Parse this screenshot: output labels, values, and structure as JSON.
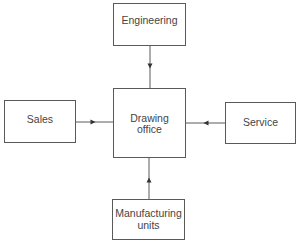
{
  "diagram": {
    "type": "block-diagram",
    "nodes": {
      "engineering": {
        "label": "Engineering"
      },
      "sales": {
        "label": "Sales"
      },
      "drawing_office": {
        "label": "Drawing\noffice"
      },
      "service": {
        "label": "Service"
      },
      "manufacturing": {
        "label": "Manufacturing\nunits"
      }
    },
    "edges": [
      {
        "from": "Engineering",
        "to": "Drawing office",
        "direction": "down"
      },
      {
        "from": "Sales",
        "to": "Drawing office",
        "direction": "right"
      },
      {
        "from": "Service",
        "to": "Drawing office",
        "direction": "left"
      },
      {
        "from": "Manufacturing units",
        "to": "Drawing office",
        "direction": "up"
      }
    ],
    "colors": {
      "line": "#5a5a5a",
      "text": "#444444",
      "background": "#ffffff"
    }
  }
}
